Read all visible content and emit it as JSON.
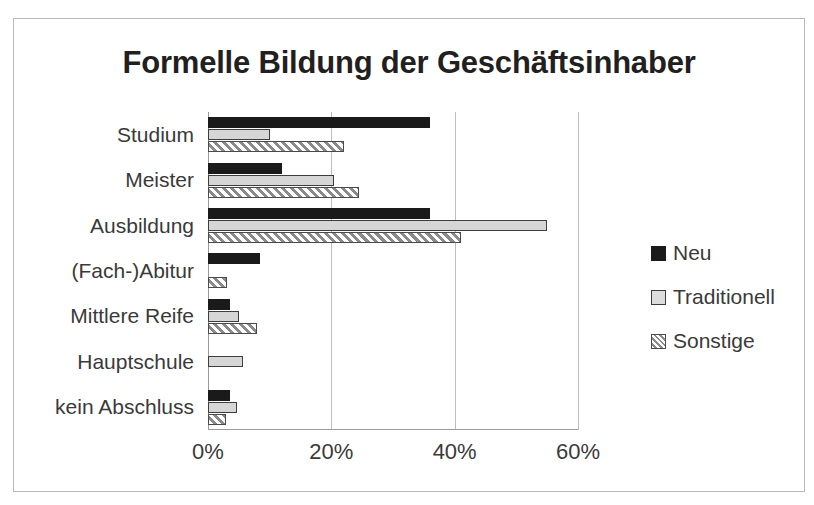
{
  "chart_data": {
    "type": "bar",
    "orientation": "horizontal",
    "title": "Formelle Bildung der Geschäftsinhaber",
    "xlabel": "",
    "ylabel": "",
    "xlim": [
      0,
      60
    ],
    "xticks": [
      "0%",
      "20%",
      "40%",
      "60%"
    ],
    "xtick_values": [
      0,
      20,
      40,
      60
    ],
    "grid": true,
    "legend_position": "right",
    "categories": [
      "Studium",
      "Meister",
      "Ausbildung",
      "(Fach-)Abitur",
      "Mittlere Reife",
      "Hauptschule",
      "kein Abschluss"
    ],
    "series": [
      {
        "name": "Neu",
        "color": "#1a1a1a",
        "pattern": "solid",
        "values": [
          36,
          12,
          36,
          8.5,
          3.6,
          0,
          3.6
        ]
      },
      {
        "name": "Traditionell",
        "color": "#d6d6d6",
        "pattern": "solid",
        "values": [
          10,
          20.5,
          55,
          0,
          5,
          5.7,
          4.7
        ]
      },
      {
        "name": "Sonstige",
        "color": "#8a8a8a",
        "pattern": "diagonal-hatch",
        "values": [
          22,
          24.5,
          41,
          3,
          8,
          0,
          2.9
        ]
      }
    ]
  },
  "chart": {
    "title": "Formelle Bildung der Geschäftsinhaber",
    "legend": [
      {
        "label": "Neu",
        "swatch": "legend-swatch-neu"
      },
      {
        "label": "Traditionell",
        "swatch": "legend-swatch-traditionell"
      },
      {
        "label": "Sonstige",
        "swatch": "legend-swatch-sonstige"
      }
    ]
  }
}
